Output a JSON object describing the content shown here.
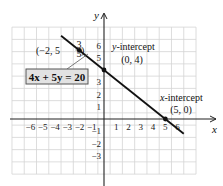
{
  "chart_data": {
    "type": "line",
    "title": "",
    "xlabel": "x",
    "ylabel": "y",
    "xlim": [
      -7.5,
      7.5
    ],
    "ylim": [
      -4.5,
      7.5
    ],
    "grid": true,
    "x_ticks": [
      -6,
      -5,
      -4,
      -3,
      -2,
      -1,
      1,
      2,
      3,
      4,
      5,
      6
    ],
    "y_ticks": [
      -3,
      -2,
      -1,
      1,
      2,
      3,
      5,
      6
    ],
    "series": [
      {
        "name": "4x + 5y = 20",
        "equation": "4x + 5y = 20",
        "x": [
          -3.5,
          6.5
        ],
        "y": [
          6.8,
          -1.2
        ]
      }
    ],
    "points": [
      {
        "label": "(-2, 5 3/5)",
        "x": -2,
        "y": 5.6
      },
      {
        "label": "y-intercept (0, 4)",
        "x": 0,
        "y": 4
      },
      {
        "label": "x-intercept (5, 0)",
        "x": 5,
        "y": 0
      }
    ],
    "annotations": {
      "equation_label": "4x + 5y = 20",
      "point_label_prefix": "(−2, 5",
      "point_frac_num": "3",
      "point_frac_den": "5",
      "point_label_suffix": ")",
      "y_intercept_title": "y-intercept",
      "y_intercept_coords": "(0, 4)",
      "x_intercept_title": "x-intercept",
      "x_intercept_title_var": "x",
      "x_intercept_title_rest": "-intercept",
      "x_intercept_coords": "(5, 0)"
    },
    "colors": {
      "line": "#111111",
      "grid": "#d4d4d4",
      "axis": "#222222",
      "label_box_fill": "#e2e2e2",
      "label_box_border": "#555555"
    }
  }
}
